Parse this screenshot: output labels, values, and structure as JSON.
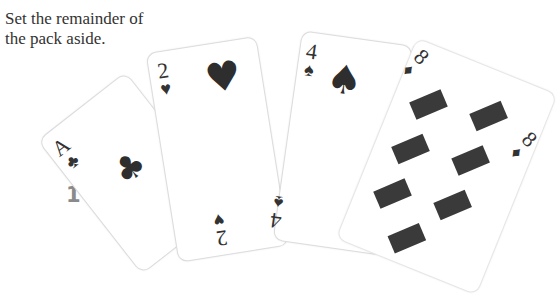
{
  "instruction": {
    "line1": "Set the remainder of",
    "line2": "the pack aside."
  },
  "step_number": "1",
  "cards": [
    {
      "rank": "A",
      "suit": "clubs",
      "glyph": "♣"
    },
    {
      "rank": "2",
      "suit": "hearts",
      "glyph": "♥"
    },
    {
      "rank": "4",
      "suit": "spades",
      "glyph": "♠"
    },
    {
      "rank": "8",
      "suit": "diamonds",
      "glyph": "♦"
    }
  ],
  "colors": {
    "text": "#333333",
    "step_number": "#8a8a8a",
    "pip": "#2e2e2e"
  }
}
